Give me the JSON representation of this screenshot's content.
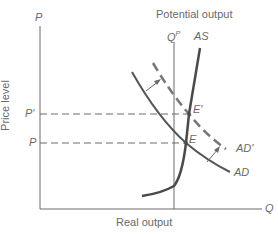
{
  "diagram": {
    "title": "Potential output",
    "y_axis": {
      "symbol": "P",
      "label": "Price level"
    },
    "x_axis": {
      "symbol": "Q",
      "label": "Real output"
    },
    "potential_output_symbol": "Q",
    "potential_output_sup": "P",
    "curves": {
      "as": "AS",
      "ad": "AD",
      "ad_shifted": "AD'"
    },
    "points": {
      "e": "E",
      "e_prime": "E'"
    },
    "price_levels": {
      "p": "P",
      "p_prime": "P'"
    },
    "colors": {
      "axis": "#6a6a6a",
      "curve": "#555555",
      "text": "#6a6a6a"
    }
  }
}
